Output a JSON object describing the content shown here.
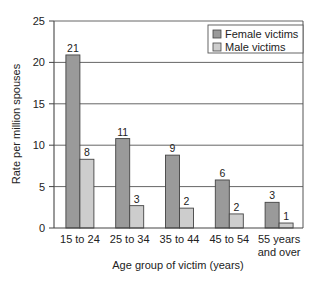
{
  "chart_data": {
    "type": "bar",
    "title": "",
    "xlabel": "Age group of victim (years)",
    "ylabel": "Rate per million spouses",
    "ylim": [
      0,
      25
    ],
    "yticks": [
      0,
      5,
      10,
      15,
      20,
      25
    ],
    "grid": true,
    "legend_position": "upper right (inside)",
    "categories": [
      "15 to 24",
      "25 to 34",
      "35 to 44",
      "45 to 54",
      "55 years and over"
    ],
    "category_lines": [
      [
        "15 to 24"
      ],
      [
        "25 to 34"
      ],
      [
        "35 to 44"
      ],
      [
        "45 to 54"
      ],
      [
        "55 years",
        "and over"
      ]
    ],
    "series": [
      {
        "name": "Female victims",
        "color": "#9a9a9a",
        "values": [
          21,
          11,
          9,
          6,
          3
        ],
        "plotted": [
          20.9,
          10.8,
          8.8,
          5.8,
          3.1
        ]
      },
      {
        "name": "Male victims",
        "color": "#cdcdcd",
        "values": [
          8,
          3,
          2,
          2,
          1
        ],
        "plotted": [
          8.3,
          2.7,
          2.4,
          1.7,
          0.6
        ]
      }
    ]
  }
}
